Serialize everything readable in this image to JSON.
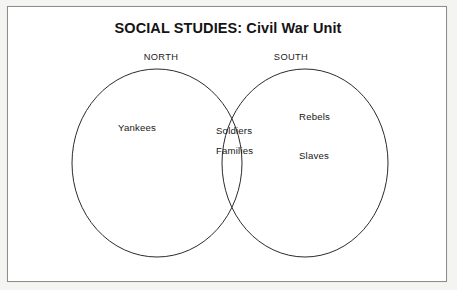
{
  "worksheet": {
    "title": "SOCIAL STUDIES: Civil War Unit",
    "frame_color": "#8d8d8d",
    "background_color": "#ffffff",
    "page_background_color": "#f4f4f2",
    "ink_color": "#171717"
  },
  "venn": {
    "type": "venn-diagram",
    "stroke_color": "#2b2b2b",
    "left_circle": {
      "caption": "NORTH",
      "items": [
        "Yankees"
      ],
      "center_x": 157,
      "center_y": 163,
      "radius_x": 85,
      "radius_y": 94
    },
    "right_circle": {
      "caption": "SOUTH",
      "items": [
        "Rebels",
        "Slaves"
      ],
      "center_x": 305,
      "center_y": 163,
      "radius_x": 83,
      "radius_y": 94
    },
    "overlap": {
      "items": [
        "Soldiers",
        "Families"
      ]
    }
  }
}
